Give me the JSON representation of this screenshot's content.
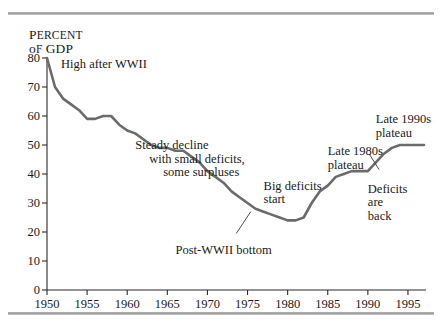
{
  "figure": {
    "axis_title_line1": "Percent",
    "axis_title_line2": "of GDP",
    "axis_title_cap1": "P",
    "axis_title_rest1": "ERCENT",
    "axis_title_cap2": "o",
    "axis_title_rest2": "f",
    "axis_title_tail2": "GDP"
  },
  "chart_data": {
    "type": "line",
    "title": "",
    "subtitle": "",
    "xlabel": "",
    "ylabel": "Percent of GDP",
    "xlim": [
      1950,
      1997
    ],
    "ylim": [
      0,
      80
    ],
    "ytick_step": 10,
    "grid": false,
    "legend": "none",
    "line_color": "#6b6b6b",
    "axis_color": "#2a2a2a",
    "yticks": [
      0,
      10,
      20,
      30,
      40,
      50,
      60,
      70,
      80
    ],
    "xticks": [
      1950,
      1955,
      1960,
      1965,
      1970,
      1975,
      1980,
      1985,
      1990,
      1995
    ],
    "series": [
      {
        "name": "Federal debt as percent of GDP",
        "x": [
          1950,
          1951,
          1952,
          1953,
          1954,
          1955,
          1956,
          1957,
          1958,
          1959,
          1960,
          1961,
          1962,
          1963,
          1964,
          1965,
          1966,
          1967,
          1968,
          1969,
          1970,
          1971,
          1972,
          1973,
          1974,
          1975,
          1976,
          1977,
          1978,
          1979,
          1980,
          1981,
          1982,
          1983,
          1984,
          1985,
          1986,
          1987,
          1988,
          1989,
          1990,
          1991,
          1992,
          1993,
          1994,
          1995,
          1996,
          1997
        ],
        "values": [
          80,
          70,
          66,
          64,
          62,
          59,
          59,
          60,
          60,
          57,
          55,
          54,
          52,
          50,
          49,
          49,
          48,
          48,
          46,
          44,
          41,
          39,
          37,
          34,
          32,
          30,
          28,
          27,
          26,
          25,
          24,
          24,
          25,
          30,
          34,
          36,
          39,
          40,
          41,
          41,
          41,
          44,
          47,
          49,
          50,
          50,
          50,
          50
        ]
      }
    ],
    "annotations": [
      {
        "name": "high-after-wwii",
        "lines": [
          "High after WWII"
        ],
        "x": 1951,
        "y": 78
      },
      {
        "name": "steady-decline",
        "lines": [
          "Steady decline",
          "with small deficits,",
          "some surpluses"
        ],
        "x": 1961,
        "y": 52
      },
      {
        "name": "post-wwii-bottom",
        "lines": [
          "Post-WWII bottom"
        ],
        "x": 1971,
        "y": 16
      },
      {
        "name": "big-deficits-start",
        "lines": [
          "Big deficits",
          "start"
        ],
        "x": 1977,
        "y": 38
      },
      {
        "name": "late-1980s-plateau",
        "lines": [
          "Late 1980s",
          "plateau"
        ],
        "x": 1985,
        "y": 50
      },
      {
        "name": "deficits-are-back",
        "lines": [
          "Deficits",
          "are",
          "back"
        ],
        "x": 1990,
        "y": 37
      },
      {
        "name": "late-1990s-plateau",
        "lines": [
          "Late 1990s",
          "plateau"
        ],
        "x": 1991,
        "y": 61
      }
    ]
  }
}
